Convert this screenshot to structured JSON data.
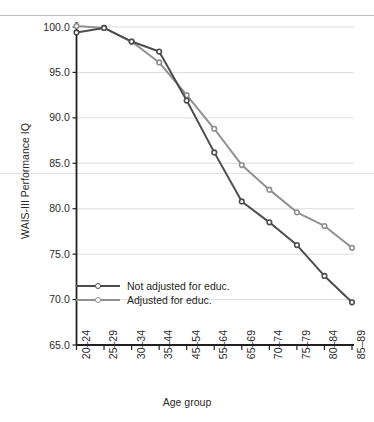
{
  "chart_data": {
    "type": "line",
    "title": "",
    "xlabel": "Age group",
    "ylabel": "WAIS-III Performance IQ",
    "categories": [
      "20–24",
      "25–29",
      "30–34",
      "35–44",
      "45–54",
      "55–64",
      "65–69",
      "70–74",
      "75–79",
      "80–84",
      "85–89"
    ],
    "ylim": [
      65.0,
      100.0
    ],
    "ytick_labels": [
      "100.0",
      "95.0",
      "90.0",
      "85.0",
      "80.0",
      "75.0",
      "70.0",
      "65.0"
    ],
    "ytick_values": [
      100.0,
      95.0,
      90.0,
      85.0,
      80.0,
      75.0,
      70.0,
      65.0
    ],
    "grid": true,
    "grid_axis": "y",
    "legend_position": "inside-lower-left",
    "series": [
      {
        "name": "Not adjusted for educ.",
        "color": "#4d4d4d",
        "marker": "circle",
        "values": [
          99.4,
          99.9,
          98.4,
          97.3,
          91.9,
          86.2,
          80.8,
          78.5,
          76.0,
          72.6,
          69.7
        ]
      },
      {
        "name": "Adjusted for educ.",
        "color": "#909090",
        "marker": "circle",
        "values": [
          100.1,
          99.9,
          98.4,
          96.1,
          92.5,
          88.8,
          84.8,
          82.1,
          79.6,
          78.1,
          75.7
        ]
      }
    ]
  },
  "axis": {
    "y_title": "WAIS-III Performance IQ",
    "x_title": "Age group"
  },
  "legend": {
    "items": [
      {
        "label": "Not adjusted for educ.",
        "color": "#4d4d4d"
      },
      {
        "label": "Adjusted for educ.",
        "color": "#909090"
      }
    ]
  },
  "colors": {
    "not_adjusted": "#4d4d4d",
    "adjusted": "#909090",
    "axis": "#231f20",
    "grid": "#dcdcdc",
    "page_rule": "#bdbdbd",
    "background": "#ffffff"
  }
}
